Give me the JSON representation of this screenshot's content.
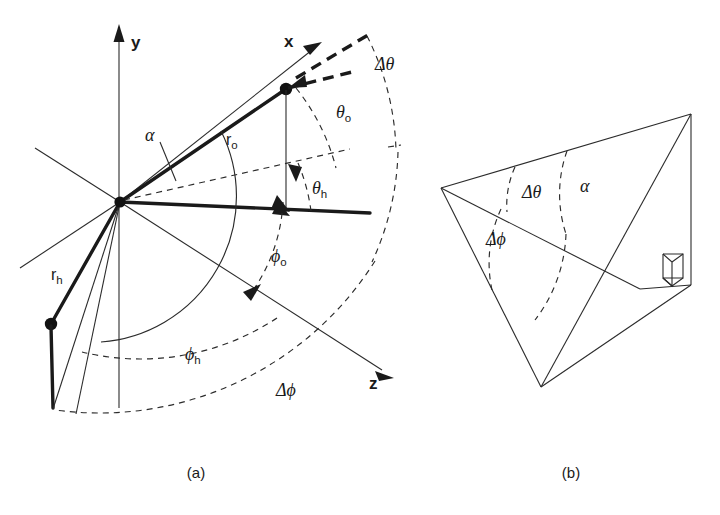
{
  "figure": {
    "background_color": "#ffffff",
    "ink_color": "#1a1a1a",
    "width": 720,
    "height": 515,
    "captions": {
      "panel_a": "(a)",
      "panel_b": "(b)"
    }
  },
  "panel_a": {
    "name": "spherical-coordinate-geometry",
    "axes": [
      {
        "id": "y",
        "label": "y",
        "direction": "up"
      },
      {
        "id": "x",
        "label": "x",
        "direction": "upper-right"
      },
      {
        "id": "z",
        "label": "z",
        "direction": "lower-right"
      }
    ],
    "vectors": [
      {
        "id": "r_o",
        "base": "r",
        "sub": "o",
        "label": "r",
        "subscript": "o",
        "style": "thick"
      },
      {
        "id": "r_h",
        "base": "r",
        "sub": "h",
        "label": "r",
        "subscript": "h",
        "style": "thick"
      }
    ],
    "angles": [
      {
        "id": "alpha",
        "glyph": "α",
        "subscript": "",
        "kind": "solid-arc"
      },
      {
        "id": "theta_o",
        "glyph": "θ",
        "subscript": "o",
        "kind": "dashed-arc"
      },
      {
        "id": "theta_h",
        "glyph": "θ",
        "subscript": "h",
        "kind": "dashed-arc"
      },
      {
        "id": "delta_theta",
        "glyph": "Δθ",
        "subscript": "",
        "kind": "dashed-arc"
      },
      {
        "id": "phi_o",
        "glyph": "ϕ",
        "subscript": "o",
        "kind": "dashed-arc"
      },
      {
        "id": "phi_h",
        "glyph": "ϕ",
        "subscript": "h",
        "kind": "dashed-arc"
      },
      {
        "id": "delta_phi",
        "glyph": "Δϕ",
        "subscript": "",
        "kind": "dashed-arc"
      }
    ],
    "labels": {
      "y_axis": "y",
      "x_axis": "x",
      "z_axis": "z",
      "r_o_base": "r",
      "r_o_sub": "o",
      "r_h_base": "r",
      "r_h_sub": "h",
      "alpha": "α",
      "theta_o_base": "θ",
      "theta_o_sub": "o",
      "theta_h_base": "θ",
      "theta_h_sub": "h",
      "delta_theta": "Δθ",
      "phi_o_base": "ϕ",
      "phi_o_sub": "o",
      "phi_h_base": "ϕ",
      "phi_h_sub": "h",
      "delta_phi": "Δϕ"
    },
    "points": [
      {
        "id": "origin",
        "role": "coordinate-origin"
      },
      {
        "id": "observer-point",
        "role": "tip-of-r-o"
      },
      {
        "id": "helio-point",
        "role": "tip-of-r-h"
      }
    ]
  },
  "panel_b": {
    "name": "scattering-angle-solid-geometry",
    "angles": [
      {
        "id": "delta_theta",
        "glyph": "Δθ",
        "kind": "dashed-arc"
      },
      {
        "id": "alpha",
        "glyph": "α",
        "kind": "dashed-arc"
      },
      {
        "id": "delta_phi",
        "glyph": "Δϕ",
        "kind": "dashed-arc"
      }
    ],
    "labels": {
      "delta_theta": "Δθ",
      "alpha": "α",
      "delta_phi": "Δϕ"
    },
    "markers": [
      {
        "id": "right-angle",
        "role": "perpendicular-indicator"
      }
    ]
  }
}
